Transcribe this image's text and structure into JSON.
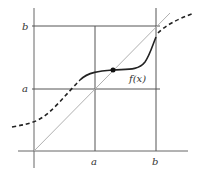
{
  "diagram": {
    "title": "",
    "labels": {
      "y_upper": "b",
      "y_lower": "a",
      "x_left": "a",
      "x_right": "b",
      "curve": "f(x)"
    },
    "colors": {
      "grid_lines": "#555555",
      "diagonal": "#aaaaaa",
      "curve": "#222222",
      "point": "#111111",
      "background": "#ffffff"
    },
    "elements": [
      "box [a,b] x [a,b]",
      "identity line y = x",
      "solid curve f(x) on [a,b]",
      "dashed extension of f outside [a,b]",
      "fixed point marker where f(x) = x"
    ]
  }
}
